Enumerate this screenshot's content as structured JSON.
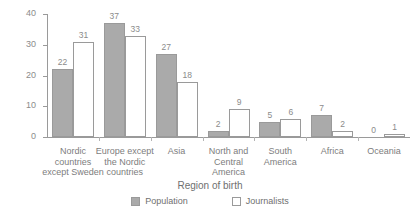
{
  "chart_data": {
    "type": "bar",
    "title": "",
    "xlabel": "Region of birth",
    "ylabel": "",
    "ylim": [
      0,
      40
    ],
    "yticks": [
      0,
      10,
      20,
      30,
      40
    ],
    "grid": false,
    "legend_position": "bottom",
    "categories": [
      "Nordic\ncountries\nexcept Sweden",
      "Europe except\nthe Nordic\ncountries",
      "Asia",
      "North and\nCentral\nAmerica",
      "South\nAmerica",
      "Africa",
      "Oceania"
    ],
    "series": [
      {
        "name": "Population",
        "color": "#aaaaaa",
        "values": [
          22,
          37,
          27,
          2,
          5,
          7,
          0
        ]
      },
      {
        "name": "Journalists",
        "color": "#ffffff",
        "values": [
          31,
          33,
          18,
          9,
          6,
          2,
          1
        ]
      }
    ]
  }
}
